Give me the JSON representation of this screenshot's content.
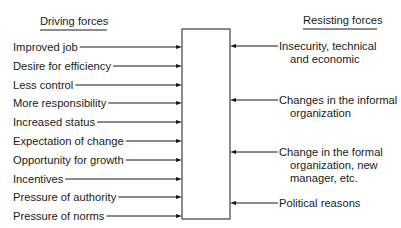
{
  "diagram": {
    "type": "force-field-analysis",
    "driving_header": "Driving forces",
    "resisting_header": "Resisting forces",
    "driving_forces": [
      {
        "label": "Improved job"
      },
      {
        "label": "Desire for efficiency"
      },
      {
        "label": "Less control"
      },
      {
        "label": "More responsibility"
      },
      {
        "label": "Increased status"
      },
      {
        "label": "Expectation of change"
      },
      {
        "label": "Opportunity for growth"
      },
      {
        "label": "Incentives"
      },
      {
        "label": "Pressure of authority"
      },
      {
        "label": "Pressure of norms"
      }
    ],
    "resisting_forces": [
      {
        "lines": [
          "Insecurity, technical",
          "and economic"
        ]
      },
      {
        "lines": [
          "Changes in the informal",
          "organization"
        ]
      },
      {
        "lines": [
          "Change in the formal",
          "organization, new",
          "manager, etc."
        ]
      },
      {
        "lines": [
          "Political reasons"
        ]
      }
    ],
    "colors": {
      "ink": "#1a1a1a",
      "background": "#ffffff"
    }
  }
}
